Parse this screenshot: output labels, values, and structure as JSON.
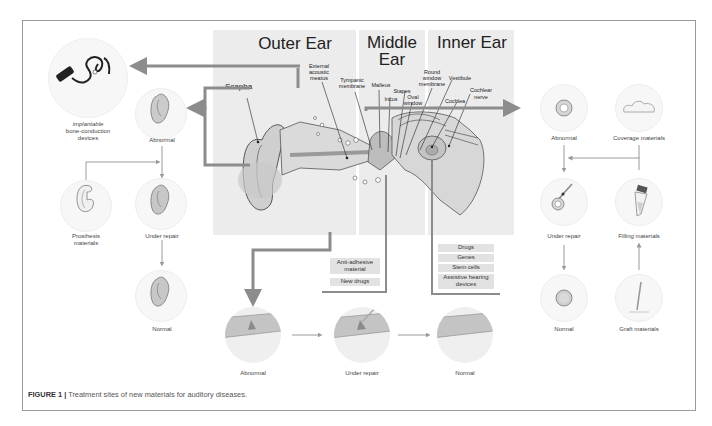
{
  "figure": {
    "caption_label": "FIGURE 1 |",
    "caption_text": " Treatment sites of new materials for auditory diseases."
  },
  "regions": {
    "outer_ear": "Outer Ear",
    "middle_ear_line1": "Middle",
    "middle_ear_line2": "Ear",
    "inner_ear": "Inner Ear"
  },
  "anatomy_labels": {
    "scapha": "Scapha",
    "external_acoustic_meatus": [
      "External",
      "acoustic",
      "meatus"
    ],
    "tympanic_membrane": [
      "Tympanic",
      "membrane"
    ],
    "malleus": "Malleus",
    "incus": "Incus",
    "stapes": "Stapes",
    "oval_window": [
      "Oval",
      "window"
    ],
    "round_window_membrane": [
      "Round",
      "window",
      "membrane"
    ],
    "vestibule": "Vestibule",
    "cochlea": "Cochlea",
    "cochlear_nerve": [
      "Cochlear",
      "nerve"
    ]
  },
  "outer_ear_panel": {
    "device_label": [
      "implantable",
      "bone-conduction",
      "devices"
    ],
    "abnormal": "Abnormal",
    "prosthesis": [
      "Prosthesis",
      "materials"
    ],
    "under_repair": "Under repair",
    "normal": "Normal"
  },
  "middle_ear_panel": {
    "tags": [
      [
        "Anti-adhesive",
        "material"
      ],
      [
        "New drugs"
      ]
    ],
    "abnormal": "Abnormal",
    "under_repair": "Under repair",
    "normal": "Normal"
  },
  "inner_ear_panel": {
    "tags": [
      "Drugs",
      "Genes",
      "Stem cells",
      [
        "Assistive hearing",
        "devices"
      ]
    ]
  },
  "tympanic_panel": {
    "abnormal": "Abnormal",
    "coverage": "Coverage materials",
    "under_repair": "Under repair",
    "filling": "Filling materials",
    "normal": "Normal",
    "graft": "Graft materials"
  },
  "colors": {
    "arrow": "#8c8c8c",
    "panel_bg": "#ececec",
    "frame_border": "#9a9a9a",
    "text": "#333333"
  }
}
